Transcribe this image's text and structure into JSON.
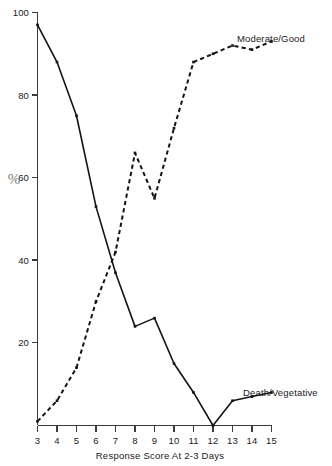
{
  "chart_data": {
    "type": "line",
    "title": "",
    "subtitle": "",
    "xlabel": "Response Score At 2-3 Days",
    "ylabel": "%",
    "x": [
      3,
      4,
      5,
      6,
      7,
      8,
      9,
      10,
      11,
      12,
      13,
      14,
      15
    ],
    "xlim": [
      3,
      15
    ],
    "ylim": [
      0,
      100
    ],
    "xticks": [
      "3",
      "4",
      "5",
      "6",
      "7",
      "8",
      "9",
      "10",
      "11",
      "12",
      "13",
      "14",
      "15"
    ],
    "yticks": [
      "0",
      "20",
      "40",
      "60",
      "80",
      "100"
    ],
    "ytick_values": [
      0,
      20,
      40,
      60,
      80,
      100
    ],
    "ytick_labels_shown": [
      "20",
      "40",
      "60",
      "80",
      "100"
    ],
    "grid": false,
    "legend_position": "inline-right-of-series",
    "series": [
      {
        "name": "Death/Vegetative",
        "style": "solid",
        "label_text": "Death/Vegetative",
        "values": [
          97,
          88,
          75,
          53,
          37,
          24,
          26,
          15,
          8,
          0,
          6,
          7,
          8
        ]
      },
      {
        "name": "Moderate/Good",
        "style": "dashed",
        "label_text": "Moderate/Good",
        "values": [
          1,
          6,
          14,
          30,
          42,
          66,
          55,
          72,
          88,
          90,
          92,
          91,
          93
        ]
      }
    ],
    "annotations": [
      {
        "text": "Moderate/Good",
        "near_x": 15,
        "near_y": 93
      },
      {
        "text": "Death/Vegetative",
        "near_x": 15,
        "near_y": 8
      }
    ]
  },
  "axes": {
    "y_axis_symbol": "%",
    "x_axis_title": "Response Score At 2-3 Days"
  }
}
